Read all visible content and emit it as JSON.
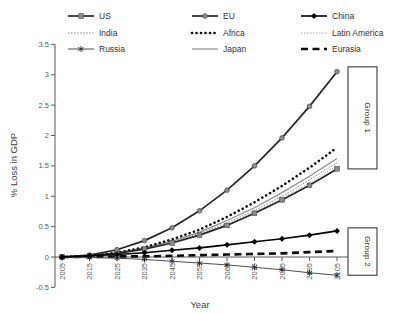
{
  "chart_data": {
    "type": "line",
    "title": "",
    "xlabel": "Year",
    "ylabel": "% Loss in GDP",
    "x": [
      2005,
      2015,
      2025,
      2035,
      2045,
      2055,
      2065,
      2075,
      2085,
      2095,
      2105
    ],
    "x_tick_labels": [
      "2005",
      "2015",
      "2025",
      "2035",
      "2045",
      "2055",
      "2065",
      "2075",
      "2085",
      "2095",
      "2105"
    ],
    "ylim": [
      -0.5,
      3.5
    ],
    "yticks": [
      3.5,
      3,
      2.5,
      2,
      1.5,
      1,
      0.5,
      0,
      -0.5
    ],
    "ytick_labels": [
      "3.5",
      "3",
      "2.5",
      "2",
      "1.5",
      "1",
      "0.5",
      "0",
      "-0.5"
    ],
    "grid": false,
    "legend_position": "top",
    "series": [
      {
        "name": "US",
        "color": "#262626",
        "line_style": "solid",
        "line_width": 1.7,
        "marker": "square",
        "marker_color": "#8c8c8c",
        "values": [
          0,
          0.02,
          0.06,
          0.13,
          0.23,
          0.36,
          0.52,
          0.72,
          0.94,
          1.18,
          1.45
        ]
      },
      {
        "name": "EU",
        "color": "#262626",
        "line_style": "solid",
        "line_width": 1.7,
        "marker": "circle",
        "marker_color": "#8c8c8c",
        "values": [
          0,
          0.03,
          0.12,
          0.27,
          0.48,
          0.76,
          1.1,
          1.5,
          1.96,
          2.48,
          3.05
        ]
      },
      {
        "name": "China",
        "color": "#000000",
        "line_style": "solid",
        "line_width": 1.6,
        "marker": "diamond",
        "marker_color": "#000000",
        "values": [
          0,
          0.02,
          0.04,
          0.07,
          0.11,
          0.15,
          0.2,
          0.25,
          0.3,
          0.36,
          0.43
        ]
      },
      {
        "name": "India",
        "color": "#808080",
        "line_style": "dotted",
        "line_width": 0.9,
        "marker": "none",
        "marker_color": "",
        "values": [
          0,
          0.02,
          0.06,
          0.14,
          0.25,
          0.39,
          0.56,
          0.77,
          1.0,
          1.27,
          1.55
        ]
      },
      {
        "name": "Africa",
        "color": "#0d0d0d",
        "line_style": "dotted-bold",
        "line_width": 2.6,
        "marker": "none",
        "marker_color": "",
        "values": [
          0,
          0.02,
          0.07,
          0.16,
          0.29,
          0.45,
          0.66,
          0.9,
          1.17,
          1.47,
          1.8
        ]
      },
      {
        "name": "Latin America",
        "color": "#a6a6a6",
        "line_style": "dotted",
        "line_width": 0.9,
        "marker": "none",
        "marker_color": "",
        "values": [
          0,
          0.02,
          0.06,
          0.13,
          0.24,
          0.37,
          0.54,
          0.74,
          0.97,
          1.22,
          1.5
        ]
      },
      {
        "name": "Russia",
        "color": "#4d4d4d",
        "line_style": "solid",
        "line_width": 1,
        "marker": "asterisk",
        "marker_color": "#262626",
        "values": [
          0,
          -0.01,
          -0.02,
          -0.04,
          -0.07,
          -0.1,
          -0.13,
          -0.17,
          -0.21,
          -0.26,
          -0.3
        ]
      },
      {
        "name": "Japan",
        "color": "#8c8c8c",
        "line_style": "solid",
        "line_width": 1.2,
        "marker": "none",
        "marker_color": "",
        "values": [
          0,
          0.02,
          0.07,
          0.15,
          0.26,
          0.41,
          0.6,
          0.81,
          1.06,
          1.33,
          1.62
        ]
      },
      {
        "name": "Eurasia",
        "color": "#0d0d0d",
        "line_style": "dashed-bold",
        "line_width": 2.6,
        "marker": "none",
        "marker_color": "",
        "values": [
          0,
          0,
          0.01,
          0.01,
          0.02,
          0.03,
          0.04,
          0.05,
          0.06,
          0.08,
          0.1
        ]
      }
    ],
    "annotations": [
      {
        "label": "Group 1",
        "y_top": 3.13,
        "y_bottom": 1.45
      },
      {
        "label": "Group 2",
        "y_top": 0.48,
        "y_bottom": -0.3
      }
    ]
  }
}
